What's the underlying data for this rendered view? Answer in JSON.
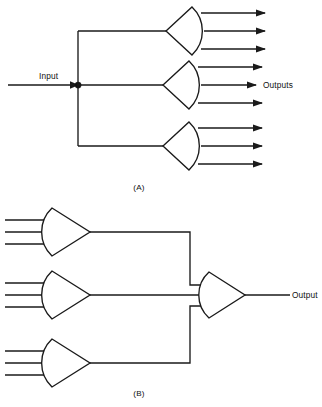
{
  "figure": {
    "type": "logic-gate-schematic",
    "background_color": "#ffffff",
    "line_color": "#1a1a1a",
    "width": 322,
    "height": 407,
    "panels": [
      {
        "id": "A",
        "caption": "(A)",
        "concept": "fan-out",
        "description": "A single input drives a vertical bus that branches to three amplifier gates, each producing three arrowed outputs.",
        "input_label": "Input",
        "output_label": "Outputs",
        "gate_count": 3,
        "outputs_per_gate": 3,
        "gate_orientation": "apex-left",
        "junction_dots": 1
      },
      {
        "id": "B",
        "caption": "(B)",
        "concept": "fan-in",
        "description": "Three amplifier gates each accept three inputs; their outputs route to a single summing gate that produces one output.",
        "output_label": "Output",
        "gate_count": 4,
        "inputs_per_gate": 3,
        "gate_orientation": "apex-right",
        "junction_dots": 0
      }
    ]
  },
  "panel_a": {
    "caption": "(A)",
    "input_label": "Input",
    "outputs_label": "Outputs",
    "gates": [
      {
        "name": "gate-a-top",
        "outputs": 3
      },
      {
        "name": "gate-a-middle",
        "outputs": 3
      },
      {
        "name": "gate-a-bottom",
        "outputs": 3
      }
    ]
  },
  "panel_b": {
    "caption": "(B)",
    "output_label": "Output",
    "gates": [
      {
        "name": "gate-b-top",
        "inputs": 3
      },
      {
        "name": "gate-b-middle",
        "inputs": 3
      },
      {
        "name": "gate-b-bottom",
        "inputs": 3
      },
      {
        "name": "gate-b-output",
        "inputs": 3
      }
    ]
  }
}
